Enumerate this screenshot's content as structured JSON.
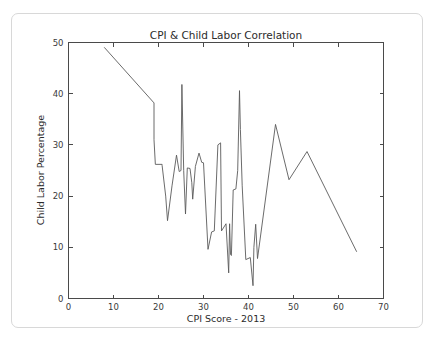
{
  "chart_data": {
    "type": "line",
    "title": "CPI & Child Labor Correlation",
    "xlabel": "CPI Score - 2013",
    "ylabel": "Child Labor Percentage",
    "xlim": [
      0,
      70
    ],
    "ylim": [
      0,
      50
    ],
    "xticks": [
      0,
      10,
      20,
      30,
      40,
      50,
      60,
      70
    ],
    "yticks": [
      0,
      10,
      20,
      30,
      40,
      50
    ],
    "grid": false,
    "legend": null,
    "series": [
      {
        "name": "Child Labor Percentage",
        "color": "#5a5a5a",
        "x": [
          8.0,
          19.0,
          19.0,
          19.3,
          20.8,
          20.8,
          21.6,
          22.0,
          23.0,
          24.0,
          24.6,
          25.0,
          25.2,
          25.6,
          26.0,
          26.4,
          27.0,
          27.4,
          27.6,
          28.2,
          29.0,
          29.6,
          30.0,
          31.0,
          31.8,
          32.4,
          33.2,
          33.8,
          34.0,
          35.0,
          35.6,
          35.8,
          36.0,
          36.2,
          36.6,
          37.2,
          37.6,
          38.0,
          38.2,
          38.6,
          39.4,
          40.4,
          41.0,
          41.2,
          41.6,
          42.0,
          46.0,
          49.0,
          53.0,
          64.0
        ],
        "y": [
          49.0,
          38.2,
          31.0,
          26.2,
          26.2,
          26.0,
          20.0,
          15.2,
          22.0,
          28.0,
          24.8,
          25.0,
          41.8,
          25.0,
          16.5,
          25.5,
          25.4,
          22.6,
          19.4,
          25.8,
          28.4,
          26.6,
          26.5,
          9.6,
          13.0,
          13.2,
          30.0,
          30.4,
          13.2,
          14.6,
          5.0,
          14.6,
          8.6,
          8.4,
          21.2,
          21.4,
          25.0,
          40.6,
          33.0,
          22.0,
          7.6,
          8.0,
          2.5,
          10.0,
          14.5,
          7.8,
          34.0,
          23.2,
          28.7,
          9.2
        ]
      }
    ]
  },
  "axes": {
    "x_tick_labels": [
      "0",
      "10",
      "20",
      "30",
      "40",
      "50",
      "60",
      "70"
    ],
    "y_tick_labels": [
      "0",
      "10",
      "20",
      "30",
      "40",
      "50"
    ]
  },
  "style": {
    "line_color": "#5a5a5a",
    "axis_color": "#4a4a4a",
    "text_color": "#2b2b2b",
    "card_border_color": "#d8d8d8",
    "background": "#ffffff"
  }
}
